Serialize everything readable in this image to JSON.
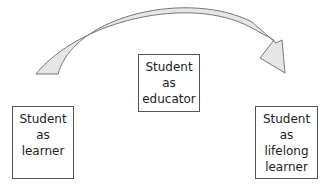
{
  "diagram": {
    "arrow": {
      "fill": "#e6e6e6",
      "stroke": "#777777",
      "direction": "left-to-right"
    },
    "boxes": [
      {
        "id": "learner",
        "lines": [
          "Student",
          "as",
          "learner"
        ]
      },
      {
        "id": "educator",
        "lines": [
          "Student",
          "as",
          "educator"
        ]
      },
      {
        "id": "lifelong",
        "lines": [
          "Student",
          "as",
          "lifelong",
          "learner"
        ]
      }
    ]
  }
}
